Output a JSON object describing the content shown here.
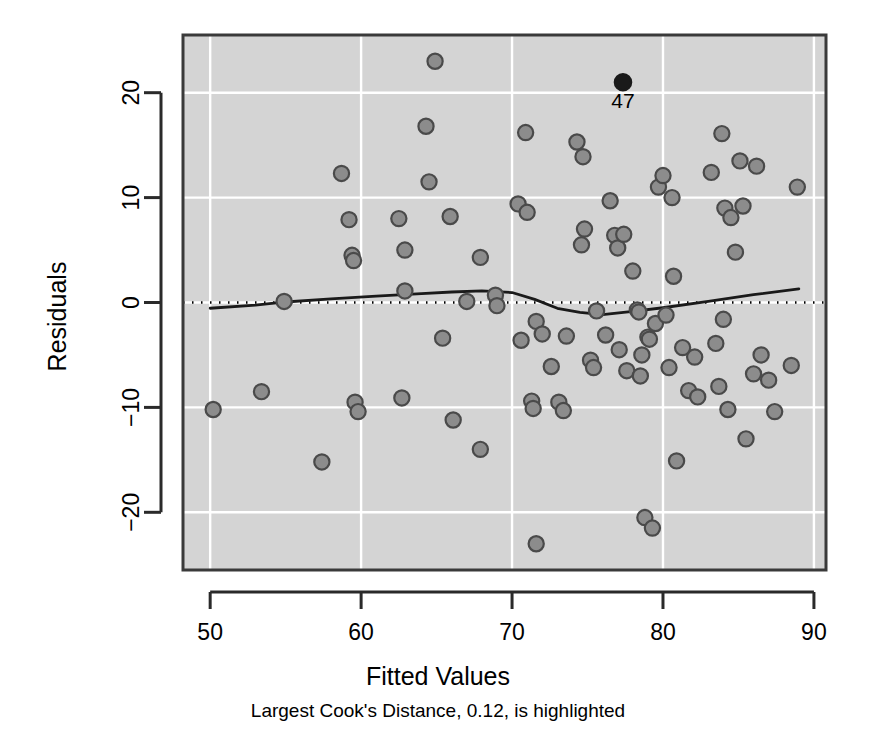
{
  "chart_data": {
    "type": "scatter",
    "title": "",
    "xlabel": "Fitted Values",
    "ylabel": "Residuals",
    "subtitle": "Largest Cook's Distance, 0.12, is highlighted",
    "xlim": [
      48.2,
      90.8
    ],
    "ylim": [
      -25.5,
      25.5
    ],
    "xticks": [
      50,
      60,
      70,
      80,
      90
    ],
    "yticks": [
      -20,
      -10,
      0,
      10,
      20
    ],
    "grid": true,
    "grid_color": "#ffffff",
    "panel_color": "#d4d4d4",
    "point_fill": "#8c8c8c",
    "point_stroke": "#4a4a4a",
    "highlight_color": "#1a1a1a",
    "legend": "none",
    "reference_line": {
      "type": "horizontal-dotted",
      "y": 0,
      "color": "#000000"
    },
    "smoother": {
      "name": "lowess",
      "color": "#1a1a1a",
      "x": [
        50.0,
        53.0,
        55.0,
        58.0,
        61.0,
        64.0,
        66.0,
        68.0,
        70.0,
        71.5,
        73.0,
        74.5,
        76.0,
        78.0,
        80.0,
        83.0,
        86.0,
        89.0
      ],
      "y": [
        -0.55,
        -0.25,
        0.05,
        0.35,
        0.6,
        0.85,
        1.0,
        1.1,
        0.95,
        0.3,
        -0.55,
        -0.95,
        -1.15,
        -0.85,
        -0.5,
        0.1,
        0.75,
        1.3
      ]
    },
    "highlighted_point": {
      "label": "47",
      "x": 77.35,
      "y": 21.0
    },
    "points": [
      {
        "x": 50.2,
        "y": -10.2
      },
      {
        "x": 53.4,
        "y": -8.5
      },
      {
        "x": 54.9,
        "y": 0.1
      },
      {
        "x": 57.4,
        "y": -15.2
      },
      {
        "x": 58.7,
        "y": 12.3
      },
      {
        "x": 59.2,
        "y": 7.9
      },
      {
        "x": 59.4,
        "y": 4.5
      },
      {
        "x": 59.5,
        "y": 4.0
      },
      {
        "x": 59.6,
        "y": -9.5
      },
      {
        "x": 59.8,
        "y": -10.4
      },
      {
        "x": 62.5,
        "y": 8.0
      },
      {
        "x": 62.9,
        "y": 5.0
      },
      {
        "x": 62.9,
        "y": 1.1
      },
      {
        "x": 62.7,
        "y": -9.1
      },
      {
        "x": 64.3,
        "y": 16.8
      },
      {
        "x": 64.5,
        "y": 11.5
      },
      {
        "x": 64.9,
        "y": 23.0
      },
      {
        "x": 65.4,
        "y": -3.4
      },
      {
        "x": 65.9,
        "y": 8.2
      },
      {
        "x": 66.1,
        "y": -11.2
      },
      {
        "x": 67.0,
        "y": 0.1
      },
      {
        "x": 67.9,
        "y": 4.3
      },
      {
        "x": 67.9,
        "y": -14.0
      },
      {
        "x": 68.9,
        "y": 0.7
      },
      {
        "x": 69.0,
        "y": -0.3
      },
      {
        "x": 70.4,
        "y": 9.4
      },
      {
        "x": 70.6,
        "y": -3.6
      },
      {
        "x": 70.9,
        "y": 16.2
      },
      {
        "x": 71.0,
        "y": 8.6
      },
      {
        "x": 71.3,
        "y": -9.4
      },
      {
        "x": 71.4,
        "y": -10.1
      },
      {
        "x": 71.6,
        "y": -1.8
      },
      {
        "x": 71.6,
        "y": -23.0
      },
      {
        "x": 72.0,
        "y": -3.0
      },
      {
        "x": 72.6,
        "y": -6.1
      },
      {
        "x": 73.1,
        "y": -9.5
      },
      {
        "x": 73.4,
        "y": -10.3
      },
      {
        "x": 73.6,
        "y": -3.2
      },
      {
        "x": 74.3,
        "y": 15.3
      },
      {
        "x": 74.6,
        "y": 5.5
      },
      {
        "x": 74.7,
        "y": 13.9
      },
      {
        "x": 74.8,
        "y": 7.0
      },
      {
        "x": 75.2,
        "y": -5.5
      },
      {
        "x": 75.4,
        "y": -6.2
      },
      {
        "x": 75.6,
        "y": -0.8
      },
      {
        "x": 76.2,
        "y": -3.1
      },
      {
        "x": 76.5,
        "y": 9.7
      },
      {
        "x": 76.8,
        "y": 6.4
      },
      {
        "x": 77.0,
        "y": 5.2
      },
      {
        "x": 77.1,
        "y": -4.5
      },
      {
        "x": 77.4,
        "y": 6.5
      },
      {
        "x": 77.6,
        "y": -6.5
      },
      {
        "x": 78.0,
        "y": 3.0
      },
      {
        "x": 78.3,
        "y": -0.7
      },
      {
        "x": 78.4,
        "y": -0.9
      },
      {
        "x": 78.5,
        "y": -7.0
      },
      {
        "x": 78.6,
        "y": -5.0
      },
      {
        "x": 78.8,
        "y": -20.5
      },
      {
        "x": 79.0,
        "y": -3.3
      },
      {
        "x": 79.1,
        "y": -3.5
      },
      {
        "x": 79.3,
        "y": -21.5
      },
      {
        "x": 79.5,
        "y": -2.0
      },
      {
        "x": 79.7,
        "y": 11.0
      },
      {
        "x": 80.0,
        "y": 12.1
      },
      {
        "x": 80.2,
        "y": -1.2
      },
      {
        "x": 80.4,
        "y": -6.2
      },
      {
        "x": 80.6,
        "y": 10.0
      },
      {
        "x": 80.7,
        "y": 2.5
      },
      {
        "x": 80.9,
        "y": -15.1
      },
      {
        "x": 81.3,
        "y": -4.3
      },
      {
        "x": 81.7,
        "y": -8.4
      },
      {
        "x": 82.1,
        "y": -5.2
      },
      {
        "x": 82.3,
        "y": -9.0
      },
      {
        "x": 83.2,
        "y": 12.4
      },
      {
        "x": 83.5,
        "y": -3.9
      },
      {
        "x": 83.7,
        "y": -8.0
      },
      {
        "x": 83.9,
        "y": 16.1
      },
      {
        "x": 84.0,
        "y": -1.6
      },
      {
        "x": 84.1,
        "y": 9.0
      },
      {
        "x": 84.3,
        "y": -10.2
      },
      {
        "x": 84.5,
        "y": 8.1
      },
      {
        "x": 84.8,
        "y": 4.8
      },
      {
        "x": 85.1,
        "y": 13.5
      },
      {
        "x": 85.3,
        "y": 9.2
      },
      {
        "x": 85.5,
        "y": -13.0
      },
      {
        "x": 86.0,
        "y": -6.8
      },
      {
        "x": 86.2,
        "y": 13.0
      },
      {
        "x": 86.5,
        "y": -5.0
      },
      {
        "x": 87.0,
        "y": -7.4
      },
      {
        "x": 87.4,
        "y": -10.4
      },
      {
        "x": 88.5,
        "y": -6.0
      },
      {
        "x": 88.9,
        "y": 11.0
      }
    ]
  }
}
